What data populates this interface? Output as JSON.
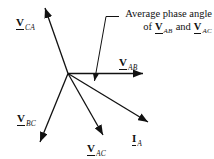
{
  "diagram": {
    "background": "#ffffff",
    "line_color": "#111111",
    "origin": {
      "x": 68,
      "y": 73.5
    },
    "vectors": [
      {
        "name": "V_CA",
        "label_main": "V",
        "label_sub": "CA",
        "tip": {
          "x": 45,
          "y": 8
        },
        "label_pos": {
          "x": 16,
          "y": 13
        }
      },
      {
        "name": "V_AB",
        "label_main": "V",
        "label_sub": "AB",
        "tip": {
          "x": 143,
          "y": 73.5
        },
        "label_pos": {
          "x": 119,
          "y": 53
        }
      },
      {
        "name": "I_A",
        "label_main": "I",
        "label_sub": "A",
        "tip": {
          "x": 148,
          "y": 122
        },
        "label_pos": {
          "x": 132,
          "y": 129
        }
      },
      {
        "name": "V_AC",
        "label_main": "V",
        "label_sub": "AC",
        "tip": {
          "x": 103,
          "y": 135
        },
        "label_pos": {
          "x": 87,
          "y": 139
        }
      },
      {
        "name": "V_BC",
        "label_main": "V",
        "label_sub": "BC",
        "tip": {
          "x": 40,
          "y": 142
        },
        "label_pos": {
          "x": 17,
          "y": 109
        }
      }
    ],
    "leader": {
      "points": [
        [
          119,
          16.5
        ],
        [
          106,
          16.5
        ],
        [
          94.5,
          81
        ]
      ]
    },
    "annotation": {
      "line1": "Average phase angle",
      "line2_of": "of",
      "line2_v1": "V",
      "line2_sub1": "AB",
      "line2_and": "and",
      "line2_v2": "V",
      "line2_sub2": "AC"
    }
  }
}
